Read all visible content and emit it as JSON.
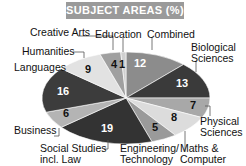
{
  "chart_data": {
    "type": "pie",
    "title": "SUBJECT AREAS (%)",
    "slices": [
      {
        "label": "Combined",
        "value": 12,
        "color": "#8c8c8c",
        "text_color": "#ffffff"
      },
      {
        "label": "Biological Sciences",
        "value": 13,
        "color": "#3a3a3a",
        "text_color": "#ffffff"
      },
      {
        "label": "Physical Sciences",
        "value": 7,
        "color": "#a8a8a8",
        "text_color": "#111111"
      },
      {
        "label": "Maths & Computer",
        "value": 8,
        "color": "#dcdcdc",
        "text_color": "#111111"
      },
      {
        "label": "Engineering/ Technology",
        "value": 5,
        "color": "#9a9a9a",
        "text_color": "#111111"
      },
      {
        "label": "Social Studies incl. Law",
        "value": 19,
        "color": "#333333",
        "text_color": "#ffffff"
      },
      {
        "label": "Business",
        "value": 6,
        "color": "#b4b4b4",
        "text_color": "#111111"
      },
      {
        "label": "Languages",
        "value": 16,
        "color": "#3c3c3c",
        "text_color": "#ffffff"
      },
      {
        "label": "Humanities",
        "value": 9,
        "color": "#e2e2e2",
        "text_color": "#111111"
      },
      {
        "label": "Creative Arts",
        "value": 4,
        "color": "#a0a0a0",
        "text_color": "#111111"
      },
      {
        "label": "Education",
        "value": 1,
        "color": "#d0d0d0",
        "text_color": "#111111"
      }
    ]
  },
  "title": "SUBJECT AREAS (%)",
  "labels": {
    "creative_arts": "Creative Arts",
    "education": "Education",
    "combined": "Combined",
    "humanities": "Humanities",
    "biological_1": "Biological",
    "biological_2": "Sciences",
    "languages": "Languages",
    "physical_1": "Physical",
    "physical_2": "Sciences",
    "business": "Business",
    "social_1": "Social Studies",
    "social_2": "incl. Law",
    "engineering_1": "Engineering/",
    "engineering_2": "Technology",
    "maths_1": "Maths &",
    "maths_2": "Computer"
  },
  "values": {
    "combined": "12",
    "biological": "13",
    "physical": "7",
    "maths": "8",
    "engineering": "5",
    "social": "19",
    "business": "6",
    "languages": "16",
    "humanities": "9",
    "creative_arts": "4",
    "education": "1"
  }
}
